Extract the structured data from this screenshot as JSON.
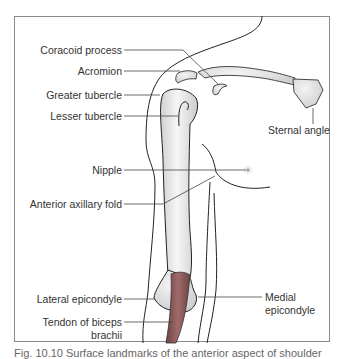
{
  "figure": {
    "type": "anatomical line drawing",
    "labels_left": [
      {
        "id": "coracoid",
        "text": "Coracoid process"
      },
      {
        "id": "acromion",
        "text": "Acromion"
      },
      {
        "id": "greater_tubercle",
        "text": "Greater tubercle"
      },
      {
        "id": "lesser_tubercle",
        "text": "Lesser tubercle"
      },
      {
        "id": "nipple",
        "text": "Nipple"
      },
      {
        "id": "axillary_fold",
        "text": "Anterior axillary fold"
      },
      {
        "id": "lateral_epicondyle",
        "text": "Lateral epicondyle"
      },
      {
        "id": "tendon_line1",
        "text": "Tendon of biceps"
      },
      {
        "id": "tendon_line2",
        "text": "brachii"
      }
    ],
    "labels_right": [
      {
        "id": "sternal_angle",
        "text": "Sternal angle"
      },
      {
        "id": "medial_line1",
        "text": "Medial"
      },
      {
        "id": "medial_line2",
        "text": "epicondyle"
      }
    ],
    "colors": {
      "outline": "#222222",
      "bone_fill": "#e4e4e4",
      "tendon_fill": "#8a5a5a",
      "frame": "#8a8a8a",
      "leader": "#444444"
    }
  },
  "caption": {
    "text": "Fig. 10.10  Surface landmarks of the anterior aspect of shoulder"
  }
}
